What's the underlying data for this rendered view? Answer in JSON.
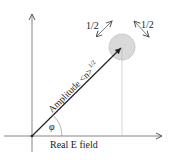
{
  "diagram": {
    "type": "phasor-diagram",
    "labels": {
      "vector": "Amplitude <n>",
      "vector_exponent": "1/2",
      "angle": "φ",
      "x_axis": "Real E field",
      "uncertainty_left": "1/2",
      "uncertainty_right": "1/2"
    },
    "colors": {
      "axis": "#555555",
      "vector": "#222222",
      "circle_fill": "#d9d9d9",
      "circle_stroke": "#999999",
      "guide": "#bbbbbb"
    }
  }
}
